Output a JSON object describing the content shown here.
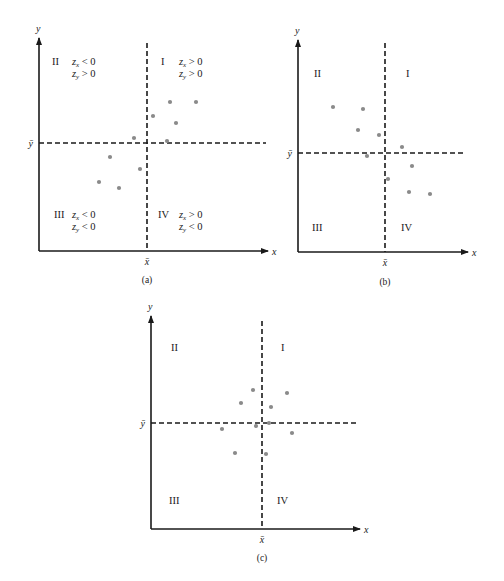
{
  "chart_data": [
    {
      "type": "scatter",
      "panel_label": "(a)",
      "xlabel": "x",
      "ylabel": "y",
      "x_mean_label": "x̄",
      "y_mean_label": "ȳ",
      "grid": false,
      "frame": {
        "axis_x": 39,
        "axis_y": 251,
        "x_end": 268,
        "y_top": 38,
        "mean_x": 147,
        "mean_y": 143,
        "vdash_top": 43,
        "hdash_end": 266
      },
      "quadrants": [
        {
          "name": "II",
          "pos": [
            52,
            65
          ],
          "zx": "< 0",
          "zy": "> 0",
          "zpos": [
            72,
            65
          ]
        },
        {
          "name": "I",
          "pos": [
            161,
            65
          ],
          "zx": "> 0",
          "zy": "> 0",
          "zpos": [
            179,
            65
          ]
        },
        {
          "name": "III",
          "pos": [
            54,
            218
          ],
          "zx": "< 0",
          "zy": "< 0",
          "zpos": [
            72,
            218
          ]
        },
        {
          "name": "IV",
          "pos": [
            158,
            218
          ],
          "zx": "> 0",
          "zy": "< 0",
          "zpos": [
            179,
            218
          ]
        }
      ],
      "points": [
        [
          170,
          102
        ],
        [
          196,
          102
        ],
        [
          153,
          116
        ],
        [
          176,
          123
        ],
        [
          134,
          138
        ],
        [
          167,
          141
        ],
        [
          110,
          157
        ],
        [
          140,
          169
        ],
        [
          99,
          182
        ],
        [
          119,
          188
        ]
      ],
      "description": "Positive association: most points fall in quadrants I and III"
    },
    {
      "type": "scatter",
      "panel_label": "(b)",
      "xlabel": "x",
      "ylabel": "y",
      "x_mean_label": "x̄",
      "y_mean_label": "ȳ",
      "grid": false,
      "frame": {
        "axis_x": 298,
        "axis_y": 252,
        "x_end": 468,
        "y_top": 40,
        "mean_x": 385,
        "mean_y": 153,
        "vdash_top": 43,
        "hdash_end": 466
      },
      "quadrants": [
        {
          "name": "II",
          "pos": [
            314,
            77
          ]
        },
        {
          "name": "I",
          "pos": [
            406,
            77
          ]
        },
        {
          "name": "III",
          "pos": [
            312,
            231
          ]
        },
        {
          "name": "IV",
          "pos": [
            401,
            231
          ]
        }
      ],
      "points": [
        [
          333,
          107
        ],
        [
          363,
          109
        ],
        [
          358,
          130
        ],
        [
          379,
          135
        ],
        [
          402,
          147
        ],
        [
          367,
          156
        ],
        [
          412,
          166
        ],
        [
          388,
          179
        ],
        [
          409,
          192
        ],
        [
          430,
          194
        ]
      ],
      "description": "Negative association: most points fall in quadrants II and IV"
    },
    {
      "type": "scatter",
      "panel_label": "(c)",
      "xlabel": "x",
      "ylabel": "y",
      "x_mean_label": "x̄",
      "y_mean_label": "ȳ",
      "grid": false,
      "frame": {
        "axis_x": 151,
        "axis_y": 529,
        "x_end": 360,
        "y_top": 316,
        "mean_x": 262,
        "mean_y": 423,
        "vdash_top": 321,
        "hdash_end": 357
      },
      "quadrants": [
        {
          "name": "II",
          "pos": [
            171,
            351
          ]
        },
        {
          "name": "I",
          "pos": [
            281,
            351
          ]
        },
        {
          "name": "III",
          "pos": [
            169,
            504
          ]
        },
        {
          "name": "IV",
          "pos": [
            277,
            504
          ]
        }
      ],
      "points": [
        [
          253,
          390
        ],
        [
          287,
          393
        ],
        [
          241,
          403
        ],
        [
          271,
          407
        ],
        [
          269,
          423
        ],
        [
          256,
          426
        ],
        [
          222,
          429
        ],
        [
          292,
          433
        ],
        [
          235,
          453
        ],
        [
          266,
          454
        ]
      ],
      "description": "No association: points scattered evenly across all four quadrants"
    }
  ],
  "colors": {
    "axis": "#1a1a1a",
    "point": "#8a8a8a",
    "background": "#ffffff"
  }
}
